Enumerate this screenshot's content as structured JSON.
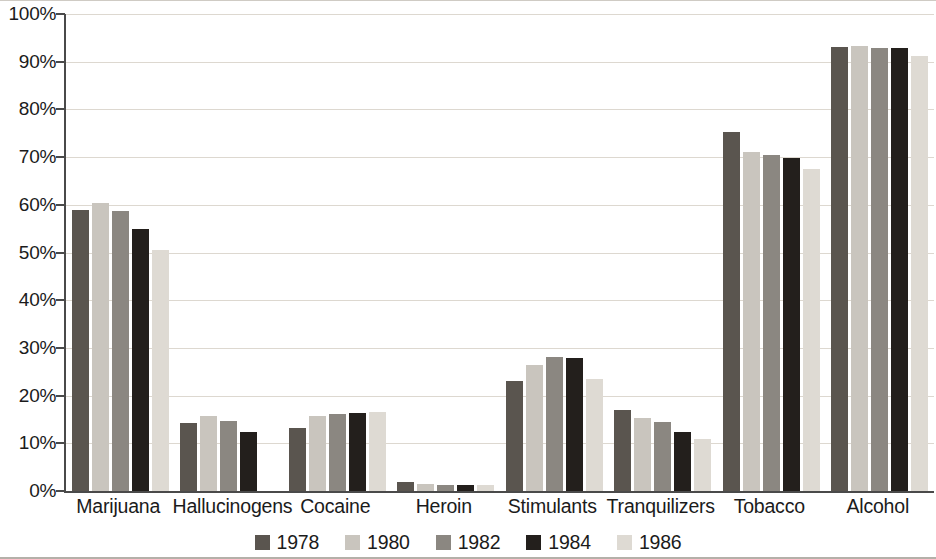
{
  "chart_data": {
    "type": "bar",
    "title": "",
    "subtitle": "",
    "xlabel": "",
    "ylabel": "",
    "ylim": [
      0,
      100
    ],
    "y_unit": "%",
    "grid": true,
    "legend_position": "bottom",
    "categories": [
      "Marijuana",
      "Hallucinogens",
      "Cocaine",
      "Heroin",
      "Stimulants",
      "Tranquilizers",
      "Tobacco",
      "Alcohol"
    ],
    "y_ticks": [
      "0%",
      "10%",
      "20%",
      "30%",
      "40%",
      "50%",
      "60%",
      "70%",
      "80%",
      "90%",
      "100%"
    ],
    "series": [
      {
        "name": "1978",
        "color": "#5a554f",
        "values": [
          59.0,
          14.3,
          13.2,
          1.8,
          23.1,
          17.0,
          75.3,
          93.1
        ]
      },
      {
        "name": "1980",
        "color": "#c9c5be",
        "values": [
          60.3,
          15.7,
          15.8,
          1.4,
          26.4,
          15.3,
          71.0,
          93.2
        ]
      },
      {
        "name": "1982",
        "color": "#8b8781",
        "values": [
          58.7,
          14.6,
          16.1,
          1.3,
          28.0,
          14.4,
          70.4,
          92.9
        ]
      },
      {
        "name": "1984",
        "color": "#231f1c",
        "values": [
          55.0,
          12.4,
          16.3,
          1.3,
          27.9,
          12.3,
          69.9,
          92.8
        ]
      },
      {
        "name": "1986",
        "color": "#dedad3",
        "values": [
          50.6,
          0.0,
          16.6,
          1.2,
          23.4,
          11.0,
          67.5,
          91.2
        ]
      }
    ]
  },
  "legend": {
    "items": [
      {
        "label": "1978",
        "color": "#5a554f"
      },
      {
        "label": "1980",
        "color": "#c9c5be"
      },
      {
        "label": "1982",
        "color": "#8b8781"
      },
      {
        "label": "1984",
        "color": "#231f1c"
      },
      {
        "label": "1986",
        "color": "#dedad3"
      }
    ]
  },
  "axis": {
    "axis_color": "#4a4a4a",
    "gridline_color": "#ddd8d0"
  }
}
